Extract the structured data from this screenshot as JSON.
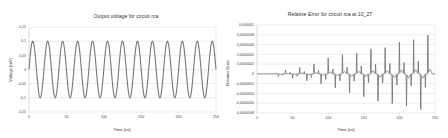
{
  "chart_data": [
    {
      "type": "line",
      "title": "Output voltage for circuit rca",
      "xlabel": "Time [ns]",
      "ylabel": "Voltage [mV]",
      "xlim": [
        0,
        250
      ],
      "ylim": [
        -0.15,
        0.15
      ],
      "xticks": [
        0,
        50,
        100,
        150,
        200,
        250
      ],
      "xtick_labels": [
        "0",
        "50",
        "100",
        "150",
        "200",
        "250"
      ],
      "yticks": [
        0.15,
        0.1,
        0.05,
        0,
        -0.05,
        -0.1,
        -0.15
      ],
      "ytick_labels": [
        "0,15",
        "0,1",
        "0,05",
        "0",
        "-0,05",
        "-0,1",
        "-0,15"
      ],
      "grid": true,
      "legend": null,
      "line_color": "#777777",
      "series": [
        {
          "name": "Output voltage",
          "function": "sine",
          "amplitude": 0.1,
          "period_ns": 20,
          "phase": 0,
          "x_start": 0,
          "x_end": 250
        }
      ]
    },
    {
      "type": "line",
      "title": "Relative Error for circuit rca at 10_27",
      "xlabel": "Time [ns]",
      "ylabel": "Relative Error",
      "xlim": [
        0,
        250
      ],
      "ylim": [
        -8e-07,
        1e-06
      ],
      "xticks": [
        0,
        50,
        100,
        150,
        200,
        250
      ],
      "xtick_labels": [
        "0",
        "50",
        "100",
        "150",
        "200",
        "250"
      ],
      "yticks": [
        1e-06,
        8e-07,
        6e-07,
        4e-07,
        2e-07,
        0,
        -2e-07,
        -4e-07,
        -6e-07,
        -8e-07
      ],
      "ytick_labels": [
        "0,000001",
        "0,0000008",
        "0,0000006",
        "0,0000004",
        "0,0000002",
        "0",
        "-0,0000002",
        "-0,0000004",
        "-0,0000006",
        "-0,0000008"
      ],
      "grid": true,
      "legend": null,
      "line_color": "#777777",
      "series": [
        {
          "name": "Relative error",
          "spikes": [
            {
              "t": 30,
              "v": -5e-08
            },
            {
              "t": 40,
              "v": 8e-08
            },
            {
              "t": 50,
              "v": -9e-08
            },
            {
              "t": 60,
              "v": 1.3e-07
            },
            {
              "t": 70,
              "v": -1.4e-07
            },
            {
              "t": 80,
              "v": 2e-07
            },
            {
              "t": 90,
              "v": -2e-07
            },
            {
              "t": 100,
              "v": 3.2e-07
            },
            {
              "t": 110,
              "v": -2.8e-07
            },
            {
              "t": 120,
              "v": 3.9e-07
            },
            {
              "t": 130,
              "v": -3.8e-07
            },
            {
              "t": 140,
              "v": 4.2e-07
            },
            {
              "t": 150,
              "v": -4.6e-07
            },
            {
              "t": 160,
              "v": 5e-07
            },
            {
              "t": 170,
              "v": -5.5e-07
            },
            {
              "t": 180,
              "v": 5.3e-07
            },
            {
              "t": 190,
              "v": -6e-07
            },
            {
              "t": 200,
              "v": 6.4e-07
            },
            {
              "t": 210,
              "v": -6.5e-07
            },
            {
              "t": 220,
              "v": 6.9e-07
            },
            {
              "t": 230,
              "v": -7.2e-07
            },
            {
              "t": 240,
              "v": 7.8e-07
            }
          ]
        }
      ]
    }
  ]
}
